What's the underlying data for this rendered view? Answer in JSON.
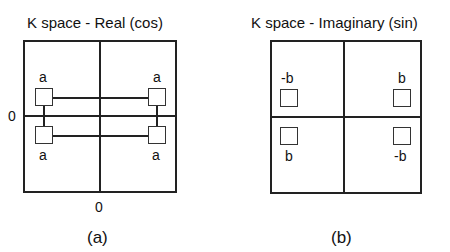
{
  "panels": [
    {
      "id": "a",
      "title": "K space - Real (cos)",
      "caption": "(a)",
      "axis_labels": {
        "ky_zero": "0",
        "kx_zero": "0"
      },
      "points": [
        {
          "position": "top-left",
          "label": "a"
        },
        {
          "position": "top-right",
          "label": "a"
        },
        {
          "position": "bottom-left",
          "label": "a"
        },
        {
          "position": "bottom-right",
          "label": "a"
        }
      ],
      "connected": true
    },
    {
      "id": "b",
      "title": "K space - Imaginary (sin)",
      "caption": "(b)",
      "points": [
        {
          "position": "top-left",
          "label": "-b"
        },
        {
          "position": "top-right",
          "label": "b"
        },
        {
          "position": "bottom-left",
          "label": "b"
        },
        {
          "position": "bottom-right",
          "label": "-b"
        }
      ],
      "connected": false
    }
  ],
  "colors": {
    "line": "#222222",
    "background": "#ffffff"
  }
}
